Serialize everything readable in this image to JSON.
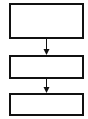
{
  "diagram": {
    "type": "flowchart",
    "nodes": [
      {
        "id": "box1",
        "label": ""
      },
      {
        "id": "box2",
        "label": ""
      },
      {
        "id": "box3",
        "label": ""
      }
    ],
    "edges": [
      {
        "from": "box1",
        "to": "box2"
      },
      {
        "from": "box2",
        "to": "box3"
      }
    ],
    "colors": {
      "stroke": "#111111",
      "background": "#ffffff"
    }
  }
}
